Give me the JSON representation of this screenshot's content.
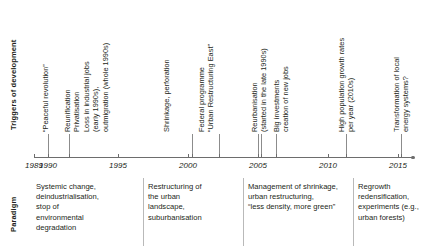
{
  "figure": {
    "row_labels": {
      "triggers": "Triggers of development",
      "paradigm": "Paradigm"
    },
    "axis": {
      "years": [
        "1989",
        "1990",
        "1995",
        "2000",
        "2005",
        "2010",
        "2015"
      ],
      "start_year": 1989,
      "end_year": 2016,
      "axis_color": "#6d6d6d"
    },
    "triggers": [
      {
        "id": "peaceful-revolution",
        "year": "1989",
        "lines": [
          "“Peaceful revolution”"
        ]
      },
      {
        "id": "reunification",
        "year": "1990",
        "lines": [
          "Reunification"
        ]
      },
      {
        "id": "privatisation",
        "year": "1990",
        "lines": [
          "Privatisation"
        ]
      },
      {
        "id": "loss-industrial-jobs",
        "year": "1991",
        "lines": [
          "Loss in industrial jobs",
          "(early 1990s),",
          "outmigration (whole 1990s)"
        ]
      },
      {
        "id": "shrinkage-perforation",
        "year": "2000",
        "lines": [
          "Shrinkage, perforation"
        ]
      },
      {
        "id": "federal-programme",
        "year": "2002",
        "lines": [
          "Federal programme",
          "“Urban Restructuring East”"
        ]
      },
      {
        "id": "reurbanisation",
        "year": "2005",
        "lines": [
          "Reurbanisation",
          "(started in the late 1990s)"
        ]
      },
      {
        "id": "big-investments",
        "year": "2006",
        "lines": [
          "Big investments",
          "creation of new jobs"
        ]
      },
      {
        "id": "high-population-growth",
        "year": "2011",
        "lines": [
          "High population growth rates",
          "per year (2010s)"
        ]
      },
      {
        "id": "energy-transformation",
        "year": "2015",
        "lines": [
          "Transformation of local",
          "energy systems?"
        ]
      }
    ],
    "paradigms": [
      {
        "id": "systemic-change",
        "lines": [
          "Systemic change,",
          "deindustrialisation,",
          "stop of",
          "environmental",
          "degradation"
        ]
      },
      {
        "id": "restructuring-urban-landscape",
        "lines": [
          "Restructuring of",
          "the urban",
          "landscape,",
          "suburbanisation"
        ]
      },
      {
        "id": "management-of-shrinkage",
        "lines": [
          "Management of shrinkage,",
          "urban restructuring,",
          "“less density, more green”"
        ]
      },
      {
        "id": "regrowth-redensification",
        "lines": [
          "Regrowth",
          "redensification,",
          "experiments (e.g.,",
          "urban forests)"
        ]
      }
    ]
  }
}
